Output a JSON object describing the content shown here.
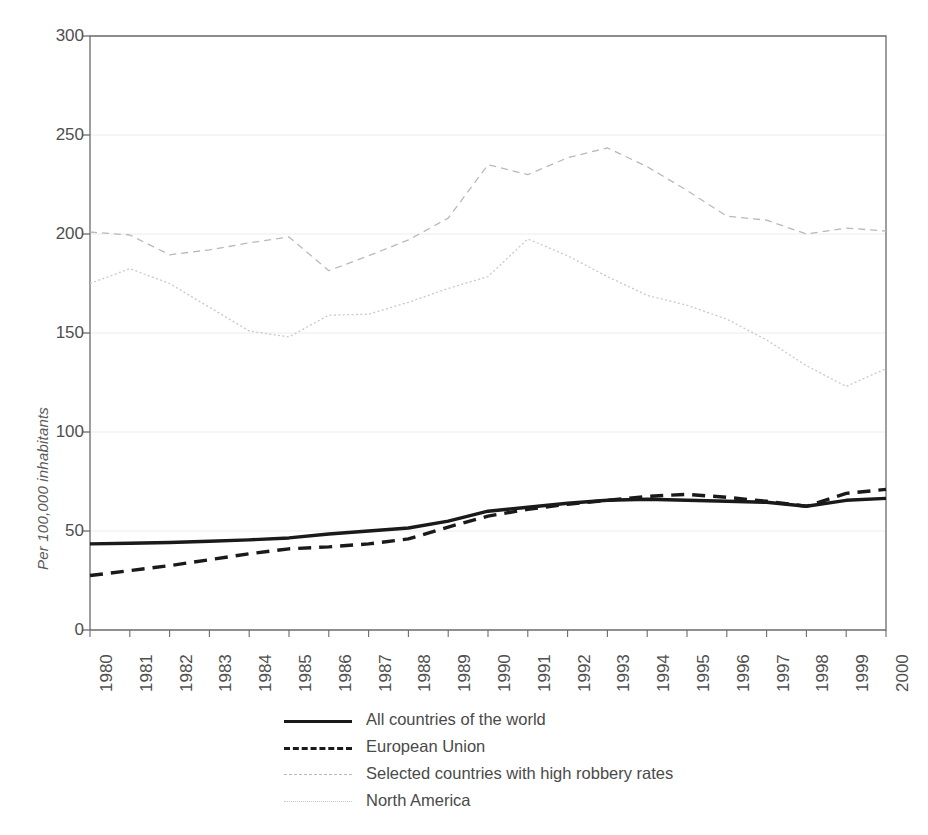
{
  "chart_data": {
    "type": "line",
    "title": "",
    "subtitle": "",
    "xlabel": "",
    "ylabel": "Per 100,000 inhabitants",
    "xlim": [
      1980,
      2000
    ],
    "ylim": [
      0,
      300
    ],
    "yticks": [
      0,
      50,
      100,
      150,
      200,
      250,
      300
    ],
    "grid": "horizontal",
    "legend_position": "bottom",
    "categories": [
      "1980",
      "1981",
      "1982",
      "1983",
      "1984",
      "1985",
      "1986",
      "1987",
      "1988",
      "1989",
      "1990",
      "1991",
      "1992",
      "1993",
      "1994",
      "1995",
      "1996",
      "1997",
      "1998",
      "1999",
      "2000"
    ],
    "x": [
      1980,
      1981,
      1982,
      1983,
      1984,
      1985,
      1986,
      1987,
      1988,
      1989,
      1990,
      1991,
      1992,
      1993,
      1994,
      1995,
      1996,
      1997,
      1998,
      1999,
      2000
    ],
    "series": [
      {
        "name": "All countries of the world",
        "style": "solid",
        "width": "thick",
        "color": "#1a1a1a",
        "values": [
          43.5,
          43.8,
          44.2,
          44.8,
          45.5,
          46.5,
          48.5,
          50.0,
          51.5,
          55.0,
          60.0,
          62.0,
          64.0,
          65.5,
          66.0,
          65.5,
          65.0,
          64.5,
          62.5,
          65.5,
          66.5
        ]
      },
      {
        "name": "European Union",
        "style": "dashed",
        "width": "thick",
        "color": "#1a1a1a",
        "values": [
          27.5,
          30.0,
          32.5,
          35.5,
          38.5,
          41.0,
          42.0,
          43.5,
          46.0,
          52.0,
          57.5,
          61.0,
          63.5,
          65.5,
          67.5,
          68.5,
          67.0,
          65.0,
          62.5,
          69.0,
          71.0
        ]
      },
      {
        "name": "Selected countries with high robbery rates",
        "style": "dashed",
        "width": "thin",
        "color": "#b9b9b9",
        "values": [
          201.0,
          199.5,
          189.5,
          192.0,
          195.5,
          198.5,
          181.5,
          189.0,
          197.0,
          208.0,
          235.0,
          230.0,
          238.5,
          243.5,
          234.0,
          222.0,
          209.0,
          207.0,
          200.0,
          203.0,
          201.5
        ]
      },
      {
        "name": "North America",
        "style": "dotted",
        "width": "thin",
        "color": "#c9c9c9",
        "values": [
          175.0,
          182.5,
          175.0,
          163.0,
          151.0,
          148.0,
          159.0,
          159.5,
          165.5,
          172.5,
          178.5,
          197.5,
          189.0,
          178.5,
          169.0,
          164.0,
          157.0,
          146.5,
          133.5,
          123.0,
          132.0
        ]
      }
    ]
  },
  "axes": {
    "ylabel": "Per 100,000 inhabitants",
    "ytick_labels": [
      "300",
      "250",
      "200",
      "150",
      "100",
      "50",
      "0"
    ],
    "xtick_labels": [
      "1980",
      "1981",
      "1982",
      "1983",
      "1984",
      "1985",
      "1986",
      "1987",
      "1988",
      "1989",
      "1990",
      "1991",
      "1992",
      "1993",
      "1994",
      "1995",
      "1996",
      "1997",
      "1998",
      "1999",
      "2000"
    ]
  },
  "legend": {
    "items": [
      {
        "label": "All countries of the world",
        "style": "solid-thick",
        "color": "#1a1a1a"
      },
      {
        "label": "European Union",
        "style": "dashed-thick",
        "color": "#1a1a1a"
      },
      {
        "label": "Selected countries with high robbery rates",
        "style": "dashed-thin",
        "color": "#b9b9b9"
      },
      {
        "label": "North America",
        "style": "dotted-thin",
        "color": "#c9c9c9"
      }
    ]
  },
  "colors": {
    "background": "#ffffff",
    "axis": "#6b6b6b",
    "grid": "#ececec",
    "text": "#4a4a4a"
  }
}
